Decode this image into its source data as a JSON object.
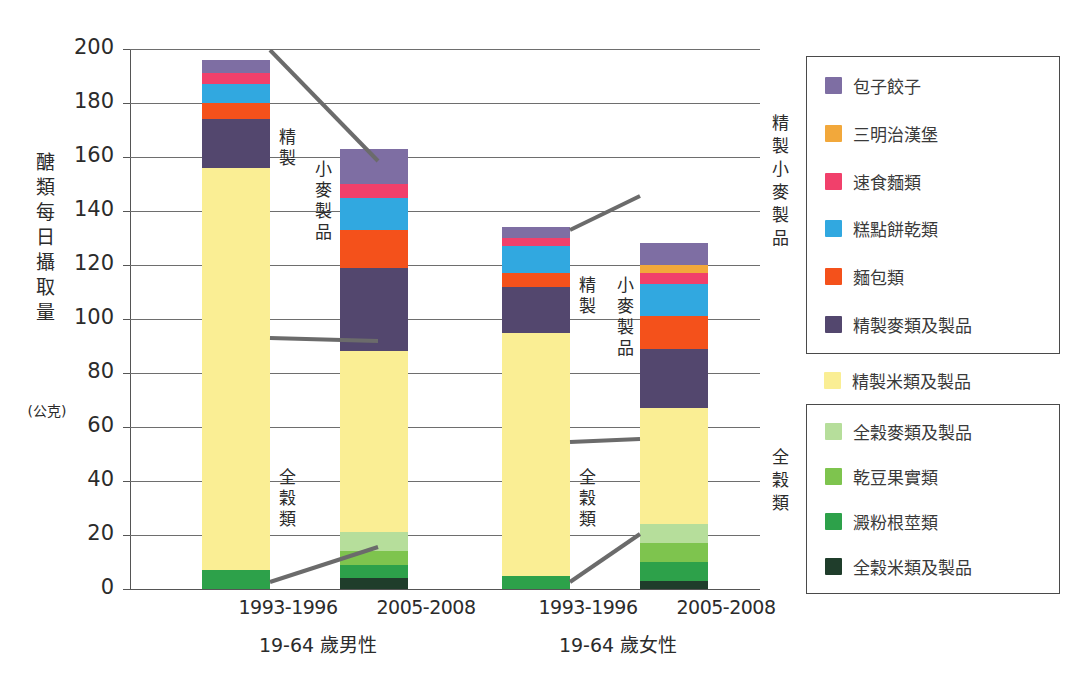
{
  "chart_data": {
    "type": "bar",
    "subtype": "stacked",
    "title": "",
    "ylabel": "醣類每日攝取量",
    "yunit": "(公克)",
    "xlabel": "",
    "ylim": [
      0,
      200
    ],
    "ytick_step": 20,
    "yticks": [
      "200",
      "180",
      "160",
      "140",
      "120",
      "100",
      "80",
      "60",
      "40",
      "20",
      "0"
    ],
    "grid": true,
    "legend_position": "right",
    "categories": [
      "1993-1996",
      "2005-2008",
      "1993-1996",
      "2005-2008"
    ],
    "groups": [
      "19-64 歲男性",
      "19-64 歲女性"
    ],
    "series": [
      {
        "name": "包子餃子",
        "color": "#7e6ea3",
        "values": [
          5,
          13,
          4,
          8
        ]
      },
      {
        "name": "三明治漢堡",
        "color": "#f2a83b",
        "values": [
          0,
          0,
          0,
          3
        ]
      },
      {
        "name": "速食麵類",
        "color": "#f1406b",
        "values": [
          4,
          5,
          3,
          4
        ]
      },
      {
        "name": "糕點餅乾類",
        "color": "#31a8e0",
        "values": [
          7,
          12,
          10,
          12
        ]
      },
      {
        "name": "麵包類",
        "color": "#f4511b",
        "values": [
          6,
          14,
          5,
          12
        ]
      },
      {
        "name": "精製麥類及製品",
        "color": "#53476e",
        "values": [
          18,
          31,
          17,
          22
        ]
      },
      {
        "name": "精製米類及製品",
        "color": "#faee94",
        "values": [
          149,
          67,
          90,
          43
        ]
      },
      {
        "name": "全穀麥類及製品",
        "color": "#b6de9b",
        "values": [
          0,
          7,
          0,
          7
        ]
      },
      {
        "name": "乾豆果實類",
        "color": "#7ec44e",
        "values": [
          0,
          5,
          0,
          7
        ]
      },
      {
        "name": "澱粉根莖類",
        "color": "#2da14a",
        "values": [
          7,
          5,
          5,
          7
        ]
      },
      {
        "name": "全穀米類及製品",
        "color": "#1f3d2b",
        "values": [
          0,
          4,
          0,
          3
        ]
      }
    ],
    "totals": [
      196,
      163,
      134,
      118
    ]
  },
  "axis": {
    "y_title_chars": [
      "醣",
      "類",
      "每",
      "日",
      "攝",
      "取",
      "量"
    ],
    "y_unit": "(公克)",
    "ticks": [
      {
        "value": 200,
        "label": "200"
      },
      {
        "value": 180,
        "label": "180"
      },
      {
        "value": 160,
        "label": "160"
      },
      {
        "value": 140,
        "label": "140"
      },
      {
        "value": 120,
        "label": "120"
      },
      {
        "value": 100,
        "label": "100"
      },
      {
        "value": 80,
        "label": "80"
      },
      {
        "value": 60,
        "label": "60"
      },
      {
        "value": 40,
        "label": "40"
      },
      {
        "value": 20,
        "label": "20"
      },
      {
        "value": 0,
        "label": "0"
      }
    ],
    "x_labels": [
      "1993-1996",
      "2005-2008",
      "1993-1996",
      "2005-2008"
    ],
    "group_labels": [
      "19-64 歲男性",
      "19-64 歲女性"
    ]
  },
  "annotations": [
    {
      "id": "a1",
      "chars": [
        "精",
        "製"
      ]
    },
    {
      "id": "a2",
      "chars": [
        "小",
        "麥",
        "製",
        "品"
      ]
    },
    {
      "id": "a3",
      "chars": [
        "全",
        "穀",
        "類"
      ]
    },
    {
      "id": "a4",
      "chars": [
        "精",
        "製"
      ]
    },
    {
      "id": "a5",
      "chars": [
        "小",
        "麥",
        "製",
        "品"
      ]
    },
    {
      "id": "a6",
      "chars": [
        "全",
        "穀",
        "類"
      ]
    }
  ],
  "legend": {
    "group_refined_wheat": {
      "chars": [
        "精",
        "製",
        "小",
        "麥",
        "製",
        "品"
      ]
    },
    "group_whole_grain": {
      "chars": [
        "全",
        "穀",
        "類"
      ]
    },
    "refined_wheat_items": [
      {
        "label": "包子餃子",
        "color": "#7e6ea3"
      },
      {
        "label": "三明治漢堡",
        "color": "#f2a83b"
      },
      {
        "label": "速食麵類",
        "color": "#f1406b"
      },
      {
        "label": "糕點餅乾類",
        "color": "#31a8e0"
      },
      {
        "label": "麵包類",
        "color": "#f4511b"
      },
      {
        "label": "精製麥類及製品",
        "color": "#53476e"
      }
    ],
    "standalone_items": [
      {
        "label": "精製米類及製品",
        "color": "#faee94"
      }
    ],
    "whole_grain_items": [
      {
        "label": "全穀麥類及製品",
        "color": "#b6de9b"
      },
      {
        "label": "乾豆果實類",
        "color": "#7ec44e"
      },
      {
        "label": "澱粉根莖類",
        "color": "#2da14a"
      },
      {
        "label": "全穀米類及製品",
        "color": "#1f3d2b"
      }
    ]
  }
}
